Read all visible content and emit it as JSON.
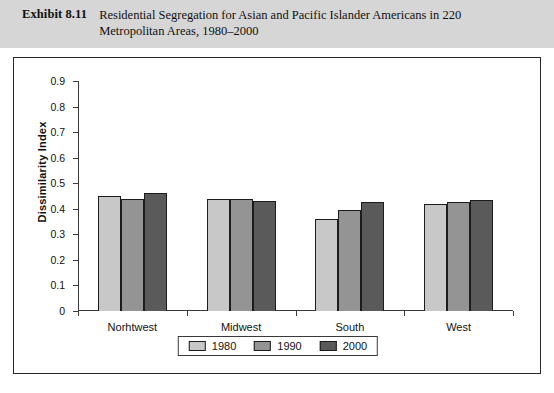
{
  "exhibit": {
    "label": "Exhibit 8.11",
    "title": "Residential Segregation for Asian and Pacific Islander Americans in 220 Metropolitan Areas, 1980–2000"
  },
  "source_note": "",
  "colors": {
    "series_1980": "#c8c8c8",
    "series_1990": "#949494",
    "series_2000": "#5a5a5a",
    "header_band": "#d6d6d6",
    "frame": "#2a2a2a",
    "bar_outline": "#1c1c1c"
  },
  "chart_data": {
    "type": "bar",
    "title": "",
    "xlabel": "",
    "ylabel": "Dissimilarity Index",
    "ylim": [
      0,
      0.9
    ],
    "ytick_labels": [
      "0",
      "0.1",
      "0.2",
      "0.3",
      "0.4",
      "0.5",
      "0.6",
      "0.7",
      "0.8",
      "0.9"
    ],
    "ytick_values": [
      0,
      0.1,
      0.2,
      0.3,
      0.4,
      0.5,
      0.6,
      0.7,
      0.8,
      0.9
    ],
    "grid": false,
    "legend_position": "bottom",
    "categories": [
      "Norhtwest",
      "Midwest",
      "South",
      "West"
    ],
    "series": [
      {
        "name": "1980",
        "values": [
          0.45,
          0.44,
          0.36,
          0.42
        ]
      },
      {
        "name": "1990",
        "values": [
          0.44,
          0.44,
          0.395,
          0.425
        ]
      },
      {
        "name": "2000",
        "values": [
          0.46,
          0.43,
          0.425,
          0.435
        ]
      }
    ]
  }
}
